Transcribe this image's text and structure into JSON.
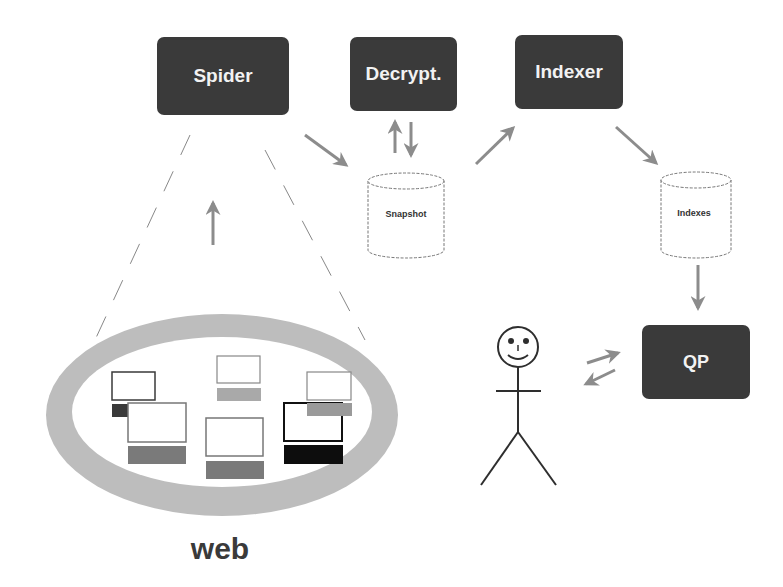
{
  "diagram": {
    "components": {
      "spider": "Spider",
      "decrypt": "Decrypt.",
      "indexer": "Indexer",
      "qp": "QP"
    },
    "stores": {
      "snapshot": "Snapshot",
      "indexes": "Indexes"
    },
    "web_label": "web",
    "colors": {
      "box_fill": "#3a3a3a",
      "box_text": "#f2f2f2",
      "arrow": "#8c8c8c",
      "ring": "#bdbdbd"
    },
    "edges": [
      {
        "from": "web",
        "to": "spider"
      },
      {
        "from": "spider",
        "to": "snapshot"
      },
      {
        "from": "snapshot",
        "to": "decrypt"
      },
      {
        "from": "decrypt",
        "to": "snapshot"
      },
      {
        "from": "snapshot",
        "to": "indexer"
      },
      {
        "from": "indexer",
        "to": "indexes"
      },
      {
        "from": "indexes",
        "to": "qp"
      },
      {
        "from": "user",
        "to": "qp"
      },
      {
        "from": "qp",
        "to": "user"
      }
    ]
  }
}
